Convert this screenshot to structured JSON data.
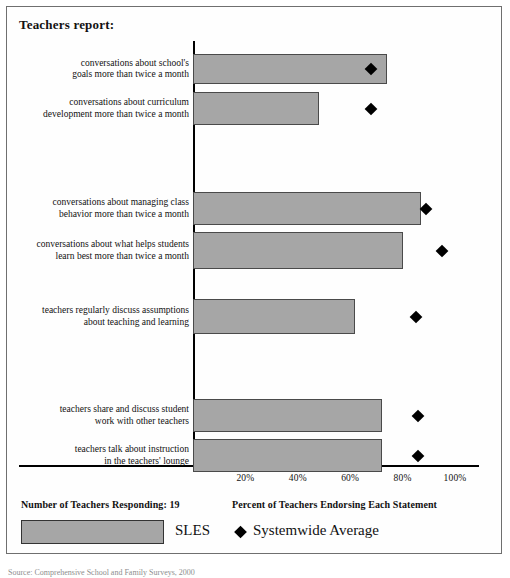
{
  "title": "Teachers report:",
  "footer": {
    "responding": "Number of Teachers Responding: 19",
    "xcaption": "Percent of Teachers Endorsing Each Statement",
    "legend_bar": "SLES",
    "legend_marker": "Systemwide Average"
  },
  "source": "Source: Comprehensive School and Family Surveys, 2000",
  "axis": {
    "ticks": [
      "20%",
      "40%",
      "60%",
      "80%",
      "100%"
    ],
    "tick_values": [
      20,
      40,
      60,
      80,
      100
    ],
    "min": 0,
    "max": 110
  },
  "colors": {
    "bar_fill": "#a6a6a6",
    "bar_stroke": "#4a4a4a",
    "marker": "#000000",
    "frame": "#6f6f6f",
    "axis": "#000000"
  },
  "chart_data": {
    "type": "bar",
    "orientation": "horizontal",
    "title": "Teachers report:",
    "xlabel": "Percent of Teachers Endorsing Each Statement",
    "ylabel": "",
    "xlim": [
      0,
      110
    ],
    "grid": false,
    "legend_position": "bottom",
    "categories": [
      "conversations about school's goals more than twice a month",
      "conversations about curriculum development more than twice a month",
      "conversations about managing class behavior more than twice a month",
      "conversations about what helps students learn best more than twice a month",
      "teachers regularly discuss assumptions about teaching and learning",
      "teachers share and discuss student work with other teachers",
      "teachers talk about instruction in the teachers' lounge"
    ],
    "category_lines": [
      [
        "conversations about school's",
        "goals more than twice a month"
      ],
      [
        "conversations about curriculum",
        "development more than twice a month"
      ],
      [
        "conversations about managing class",
        "behavior more than twice a month"
      ],
      [
        "conversations about what helps students",
        "learn best more than twice a month"
      ],
      [
        "teachers regularly discuss assumptions",
        "about teaching and learning"
      ],
      [
        "teachers share and discuss student",
        "work with other teachers"
      ],
      [
        "teachers talk about instruction",
        "in the teachers' lounge"
      ]
    ],
    "series": [
      {
        "name": "SLES",
        "type": "bar",
        "values": [
          74,
          48,
          87,
          80,
          62,
          72,
          72
        ]
      },
      {
        "name": "Systemwide Average",
        "type": "marker",
        "values": [
          68,
          68,
          89,
          95,
          85,
          86,
          86
        ]
      }
    ],
    "group_breaks": [
      2,
      4,
      5
    ]
  },
  "geometry": {
    "rows": [
      {
        "top": 47,
        "height": 30
      },
      {
        "top": 85,
        "height": 33
      },
      {
        "top": 185,
        "height": 33
      },
      {
        "top": 225,
        "height": 37
      },
      {
        "top": 292,
        "height": 35
      },
      {
        "top": 392,
        "height": 33
      },
      {
        "top": 432,
        "height": 33
      }
    ],
    "x0": 186,
    "px_per_pct": 2.62
  }
}
